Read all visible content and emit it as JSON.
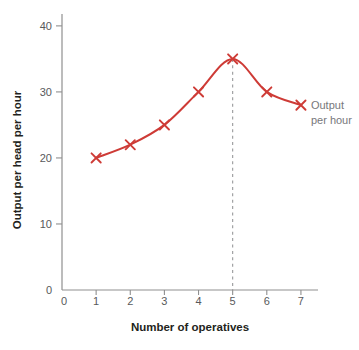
{
  "chart_data": {
    "type": "line",
    "title": "",
    "xlabel": "Number of operatives",
    "ylabel": "Output per head per hour",
    "x": [
      1,
      2,
      3,
      4,
      5,
      6,
      7
    ],
    "series": [
      {
        "name": "Output per hour",
        "values": [
          20,
          22,
          25,
          30,
          35,
          30,
          28
        ],
        "marker": "x"
      }
    ],
    "x_ticks": [
      0,
      1,
      2,
      3,
      4,
      5,
      6,
      7
    ],
    "y_ticks": [
      0,
      10,
      20,
      30,
      40
    ],
    "xlim": [
      0,
      7.5
    ],
    "ylim": [
      0,
      41.8
    ],
    "grid": false,
    "annotation": {
      "lines": [
        "Output",
        "per hour"
      ],
      "anchor_x": 7,
      "anchor_y": 28
    },
    "guide_line": {
      "style": "vertical-dashed",
      "x": 5,
      "from_y": 35,
      "to_y": 0
    }
  },
  "colors": {
    "line": "#ce3b36",
    "axis": "#8f8f8f",
    "tick_label": "#58595b",
    "axis_title": "#231f20",
    "annotation": "#77787b",
    "guide": "#98999b"
  }
}
